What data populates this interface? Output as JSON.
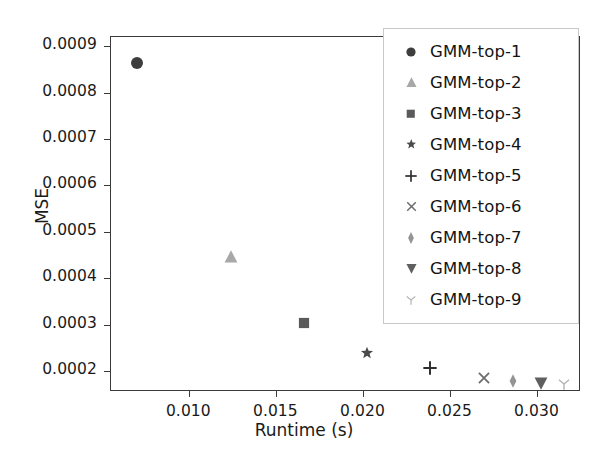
{
  "chart_data": {
    "type": "scatter",
    "title": "",
    "xlabel": "Runtime (s)",
    "ylabel": "MSE",
    "xlim": [
      0.0055,
      0.0325
    ],
    "ylim": [
      0.000155,
      0.00092
    ],
    "xticks": [
      0.01,
      0.015,
      0.02,
      0.025,
      0.03
    ],
    "xtick_labels": [
      "0.010",
      "0.015",
      "0.020",
      "0.025",
      "0.030"
    ],
    "yticks": [
      0.0002,
      0.0003,
      0.0004,
      0.0005,
      0.0006,
      0.0007,
      0.0008,
      0.0009
    ],
    "ytick_labels": [
      "0.0002",
      "0.0003",
      "0.0004",
      "0.0005",
      "0.0006",
      "0.0007",
      "0.0008",
      "0.0009"
    ],
    "grid": false,
    "legend_position": "upper right",
    "series": [
      {
        "name": "GMM-top-1",
        "marker": "circle",
        "color": "#3d3d3d",
        "x": 0.007,
        "y": 0.000865
      },
      {
        "name": "GMM-top-2",
        "marker": "triangle-up",
        "color": "#a8a8a8",
        "x": 0.0124,
        "y": 0.000445
      },
      {
        "name": "GMM-top-3",
        "marker": "square",
        "color": "#5a5a5a",
        "x": 0.0166,
        "y": 0.000303
      },
      {
        "name": "GMM-top-4",
        "marker": "star",
        "color": "#4a4a4a",
        "x": 0.0202,
        "y": 0.00024
      },
      {
        "name": "GMM-top-5",
        "marker": "plus",
        "color": "#2e2e2e",
        "x": 0.0238,
        "y": 0.000206
      },
      {
        "name": "GMM-top-6",
        "marker": "x",
        "color": "#6e6e6e",
        "x": 0.0269,
        "y": 0.000185
      },
      {
        "name": "GMM-top-7",
        "marker": "thin-diamond",
        "color": "#949494",
        "x": 0.0286,
        "y": 0.000178
      },
      {
        "name": "GMM-top-8",
        "marker": "triangle-down",
        "color": "#5f5f5f",
        "x": 0.0302,
        "y": 0.000174
      },
      {
        "name": "GMM-top-9",
        "marker": "tri-down",
        "color": "#b4b4b4",
        "x": 0.0315,
        "y": 0.000172
      }
    ]
  },
  "legend": {
    "entries": [
      {
        "label": "GMM-top-1"
      },
      {
        "label": "GMM-top-2"
      },
      {
        "label": "GMM-top-3"
      },
      {
        "label": "GMM-top-4"
      },
      {
        "label": "GMM-top-5"
      },
      {
        "label": "GMM-top-6"
      },
      {
        "label": "GMM-top-7"
      },
      {
        "label": "GMM-top-8"
      },
      {
        "label": "GMM-top-9"
      }
    ]
  },
  "colors": {
    "axis": "#3a3a3a",
    "text": "#1a1a1a",
    "background": "#ffffff",
    "legend_border": "#c8c8c8"
  }
}
